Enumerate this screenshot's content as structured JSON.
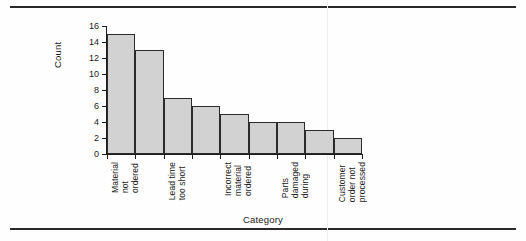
{
  "chart_data": {
    "type": "bar",
    "title": "",
    "subtitle": "",
    "xlabel": "Category",
    "ylabel": "Count",
    "ylim": [
      0,
      16
    ],
    "ytick_step": 2,
    "yticks": [
      0,
      2,
      4,
      6,
      8,
      10,
      12,
      14,
      16
    ],
    "grid": false,
    "legend": false,
    "legend_position": "none",
    "orientation": "vertical",
    "bar_fill_color": "#d2d2d2",
    "bar_edge_color": "#2b2b2b",
    "axis_color": "#1d1d1d",
    "background_color": "#ffffff",
    "categories": [
      "Material not ordered",
      "",
      "Lead time too short",
      "",
      "Incorrect material ordered",
      "",
      "Parts damaged during",
      "",
      "Customer order not processed"
    ],
    "tick_labels": [
      {
        "index": 0,
        "lines": [
          "Material",
          "not",
          "ordered"
        ]
      },
      {
        "index": 2,
        "lines": [
          "Lead time",
          "too short"
        ]
      },
      {
        "index": 4,
        "lines": [
          "Incorrect",
          "material",
          "ordered"
        ]
      },
      {
        "index": 6,
        "lines": [
          "Parts",
          "damaged",
          "during"
        ]
      },
      {
        "index": 8,
        "lines": [
          "Customer",
          "order not",
          "processed"
        ]
      }
    ],
    "values": [
      15,
      13,
      7,
      6,
      5,
      4,
      4,
      3,
      2
    ],
    "bars": [
      {
        "label": "Material not ordered",
        "value": 15
      },
      {
        "label": "",
        "value": 13
      },
      {
        "label": "Lead time too short",
        "value": 7
      },
      {
        "label": "",
        "value": 6
      },
      {
        "label": "Incorrect material ordered",
        "value": 5
      },
      {
        "label": "",
        "value": 4
      },
      {
        "label": "Parts damaged during",
        "value": 4
      },
      {
        "label": "",
        "value": 3
      },
      {
        "label": "Customer order not processed",
        "value": 2
      }
    ]
  }
}
